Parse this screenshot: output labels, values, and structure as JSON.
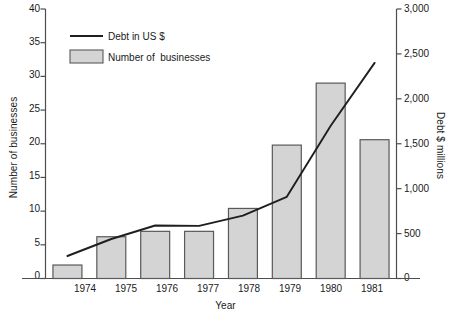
{
  "chart_data": {
    "type": "bar",
    "title": "",
    "xlabel": "Year",
    "ylabel": "Number of businesses",
    "y2label": "Debt $ millions",
    "categories": [
      "1974",
      "1975",
      "1976",
      "1977",
      "1978",
      "1979",
      "1980",
      "1981"
    ],
    "ylim": [
      0,
      40
    ],
    "yticks": [
      "0",
      "5",
      "10",
      "15",
      "20",
      "25",
      "30",
      "35",
      "40"
    ],
    "ytick_values": [
      0,
      5,
      10,
      15,
      20,
      25,
      30,
      35,
      40
    ],
    "y2lim": [
      0,
      3000
    ],
    "y2ticks": [
      "0",
      "500",
      "1,000",
      "1,500",
      "2,000",
      "2,500",
      "3,000"
    ],
    "y2tick_values": [
      0,
      500,
      1000,
      1500,
      2000,
      2500,
      3000
    ],
    "grid": false,
    "legend_position": "upper-left-inside",
    "series": [
      {
        "name": "Number of  businesses",
        "type": "bar",
        "axis": "left",
        "values": [
          2.0,
          6.2,
          7.0,
          7.0,
          10.4,
          19.8,
          29.0,
          20.6
        ],
        "fill_color": "#d4d4d4",
        "edge_color": "#595959"
      },
      {
        "name": "Debt in US $",
        "type": "line",
        "axis": "right",
        "values": [
          250,
          440,
          590,
          585,
          700,
          910,
          1700,
          2400
        ],
        "line_color": "#1f1f1f"
      }
    ]
  },
  "legend": {
    "items": [
      {
        "label": "Debt in US $",
        "marker": "line-swatch"
      },
      {
        "label": "Number of  businesses",
        "marker": "rect-swatch"
      }
    ]
  },
  "colors": {
    "bar_fill": "#d4d4d4",
    "bar_edge": "#595959",
    "line": "#1f1f1f",
    "axis": "#4d4d4d",
    "text": "#1a1a1a",
    "background": "#ffffff"
  }
}
